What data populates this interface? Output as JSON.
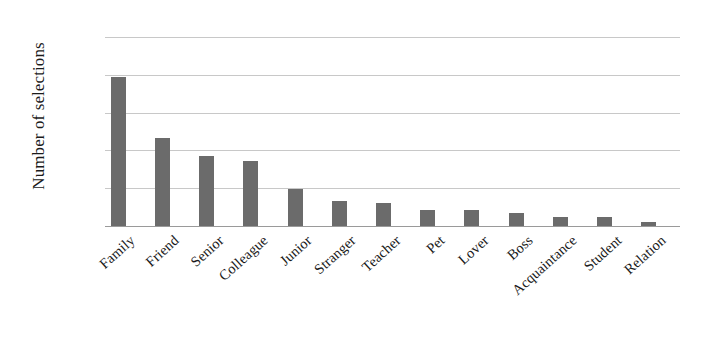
{
  "chart_data": {
    "type": "bar",
    "title": "",
    "xlabel": "",
    "ylabel": "Number of selections",
    "categories": [
      "Family",
      "Friend",
      "Senior",
      "Colleague",
      "Junior",
      "Stranger",
      "Teacher",
      "Pet",
      "Lover",
      "Boss",
      "Acquaintance",
      "Student",
      "Relation"
    ],
    "values": [
      3950,
      2320,
      1840,
      1720,
      980,
      670,
      620,
      430,
      420,
      340,
      230,
      240,
      110
    ],
    "ylim": [
      0,
      5000
    ],
    "ytick_values": [
      0,
      1000,
      2000,
      3000,
      4000,
      5000
    ],
    "ytick_labels": [
      "0",
      "1,000",
      "2,000",
      "3,000",
      "4,000",
      "5,000"
    ],
    "grid": true,
    "legend": false,
    "bar_color": "#6b6b6b",
    "gridline_color": "#c8c8c8",
    "background_color": "#ffffff"
  }
}
